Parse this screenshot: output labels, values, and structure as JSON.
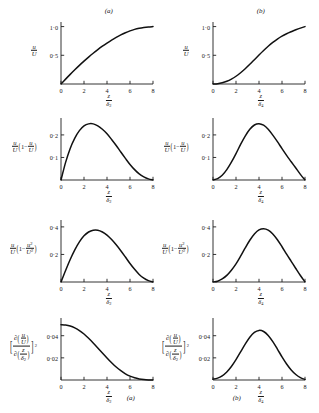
{
  "figure": {
    "panel_tag_a": "(a)",
    "panel_tag_b": "(b)",
    "bottom_tag_a": "(a)",
    "bottom_tag_b": "(b)",
    "symbols": {
      "u": "u",
      "U": "U",
      "z": "z",
      "delta": "δ",
      "sub2": "2",
      "sub4": "4",
      "partial": "∂",
      "one": "1",
      "minus": "−",
      "sq": "2",
      "open_paren": "(",
      "close_paren": ")",
      "open_brack": "[",
      "close_brack": "]"
    },
    "xticklabels": [
      "0",
      "2",
      "4",
      "6",
      "8"
    ],
    "xtickvalues": [
      0,
      2,
      4,
      6,
      8
    ],
    "rows": [
      {
        "ylabel_kind": "u_over_U",
        "yticklabels": [
          "1·0",
          "0·5"
        ],
        "ytickvalues": [
          1.0,
          0.5
        ],
        "ylim": [
          0,
          1.08
        ]
      },
      {
        "ylabel_kind": "mom_thickness",
        "yticklabels": [
          "0·2",
          "0·1"
        ],
        "ytickvalues": [
          0.2,
          0.1
        ],
        "ylim": [
          0,
          0.275
        ]
      },
      {
        "ylabel_kind": "energy_thickness",
        "yticklabels": [
          "0·4",
          "0·2"
        ],
        "ytickvalues": [
          0.4,
          0.2
        ],
        "ylim": [
          0,
          0.45
        ]
      },
      {
        "ylabel_kind": "grad_squared",
        "yticklabels": [
          "0·04",
          "0·02"
        ],
        "ytickvalues": [
          0.04,
          0.02
        ],
        "ylim": [
          0,
          0.056
        ]
      }
    ]
  },
  "chart_data": [
    {
      "id": "r1a",
      "type": "line",
      "title": "(a)",
      "xlabel": "z/δ₂",
      "ylabel": "u/U",
      "xlim": [
        0,
        8
      ],
      "ylim": [
        0,
        1.08
      ],
      "xticks": [
        0,
        2,
        4,
        6,
        8
      ],
      "yticks": [
        0.5,
        1.0
      ],
      "grid": false,
      "x": [
        0,
        0.4,
        0.8,
        1.2,
        1.6,
        2.0,
        2.4,
        2.8,
        3.2,
        3.6,
        4.0,
        4.4,
        4.8,
        5.2,
        5.6,
        6.0,
        6.4,
        6.8,
        7.2,
        7.6,
        8.0
      ],
      "y": [
        0.0,
        0.085,
        0.168,
        0.248,
        0.325,
        0.398,
        0.468,
        0.535,
        0.598,
        0.658,
        0.713,
        0.765,
        0.812,
        0.855,
        0.893,
        0.925,
        0.952,
        0.972,
        0.986,
        0.995,
        1.0
      ]
    },
    {
      "id": "r1b",
      "type": "line",
      "title": "(b)",
      "xlabel": "z/δ₄",
      "ylabel": "u/U",
      "xlim": [
        0,
        8
      ],
      "ylim": [
        0,
        1.08
      ],
      "xticks": [
        0,
        2,
        4,
        6,
        8
      ],
      "yticks": [
        0.5,
        1.0
      ],
      "grid": false,
      "x": [
        0,
        0.4,
        0.8,
        1.2,
        1.6,
        2.0,
        2.4,
        2.8,
        3.2,
        3.6,
        4.0,
        4.4,
        4.8,
        5.2,
        5.6,
        6.0,
        6.4,
        6.8,
        7.2,
        7.6,
        8.0
      ],
      "y": [
        0.0,
        0.006,
        0.022,
        0.048,
        0.086,
        0.135,
        0.196,
        0.266,
        0.343,
        0.424,
        0.505,
        0.584,
        0.658,
        0.725,
        0.783,
        0.833,
        0.875,
        0.911,
        0.944,
        0.974,
        1.0
      ]
    },
    {
      "id": "r2a",
      "type": "line",
      "title": "",
      "xlabel": "z/δ₂",
      "ylabel": "(u/U)(1−u/U)",
      "xlim": [
        0,
        8
      ],
      "ylim": [
        0,
        0.275
      ],
      "xticks": [
        0,
        2,
        4,
        6,
        8
      ],
      "yticks": [
        0.1,
        0.2
      ],
      "grid": false,
      "x": [
        0,
        0.4,
        0.8,
        1.2,
        1.6,
        2.0,
        2.4,
        2.8,
        3.2,
        3.6,
        4.0,
        4.4,
        4.8,
        5.2,
        5.6,
        6.0,
        6.4,
        6.8,
        7.2,
        7.6,
        8.0
      ],
      "y": [
        0.0,
        0.078,
        0.14,
        0.186,
        0.219,
        0.24,
        0.249,
        0.249,
        0.24,
        0.225,
        0.205,
        0.18,
        0.153,
        0.124,
        0.096,
        0.069,
        0.046,
        0.027,
        0.014,
        0.005,
        0.0
      ]
    },
    {
      "id": "r2b",
      "type": "line",
      "title": "",
      "xlabel": "z/δ₄",
      "ylabel": "(u/U)(1−u/U)",
      "xlim": [
        0,
        8
      ],
      "ylim": [
        0,
        0.275
      ],
      "xticks": [
        0,
        2,
        4,
        6,
        8
      ],
      "yticks": [
        0.1,
        0.2
      ],
      "grid": false,
      "x": [
        0,
        0.4,
        0.8,
        1.2,
        1.6,
        2.0,
        2.4,
        2.8,
        3.2,
        3.6,
        4.0,
        4.4,
        4.8,
        5.2,
        5.6,
        6.0,
        6.4,
        6.8,
        7.2,
        7.6,
        8.0
      ],
      "y": [
        0.0,
        0.006,
        0.021,
        0.046,
        0.079,
        0.117,
        0.158,
        0.195,
        0.225,
        0.244,
        0.25,
        0.243,
        0.225,
        0.199,
        0.17,
        0.139,
        0.109,
        0.081,
        0.053,
        0.025,
        0.0
      ]
    },
    {
      "id": "r3a",
      "type": "line",
      "title": "",
      "xlabel": "z/δ₂",
      "ylabel": "(u/U)(1−u²/U²)",
      "xlim": [
        0,
        8
      ],
      "ylim": [
        0,
        0.45
      ],
      "xticks": [
        0,
        2,
        4,
        6,
        8
      ],
      "yticks": [
        0.2,
        0.4
      ],
      "grid": false,
      "x": [
        0,
        0.4,
        0.8,
        1.2,
        1.6,
        2.0,
        2.4,
        2.8,
        3.2,
        3.6,
        4.0,
        4.4,
        4.8,
        5.2,
        5.6,
        6.0,
        6.4,
        6.8,
        7.2,
        7.6,
        8.0
      ],
      "y": [
        0.0,
        0.084,
        0.163,
        0.233,
        0.291,
        0.335,
        0.363,
        0.376,
        0.376,
        0.363,
        0.34,
        0.308,
        0.27,
        0.227,
        0.181,
        0.134,
        0.092,
        0.055,
        0.028,
        0.01,
        0.0
      ]
    },
    {
      "id": "r3b",
      "type": "line",
      "title": "",
      "xlabel": "z/δ₄",
      "ylabel": "(u/U)(1−u²/U²)",
      "xlim": [
        0,
        8
      ],
      "ylim": [
        0,
        0.45
      ],
      "xticks": [
        0,
        2,
        4,
        6,
        8
      ],
      "yticks": [
        0.2,
        0.4
      ],
      "grid": false,
      "x": [
        0,
        0.4,
        0.8,
        1.2,
        1.6,
        2.0,
        2.4,
        2.8,
        3.2,
        3.6,
        4.0,
        4.4,
        4.8,
        5.2,
        5.6,
        6.0,
        6.4,
        6.8,
        7.2,
        7.6,
        8.0
      ],
      "y": [
        0.0,
        0.006,
        0.022,
        0.048,
        0.085,
        0.131,
        0.187,
        0.247,
        0.303,
        0.349,
        0.378,
        0.387,
        0.377,
        0.349,
        0.307,
        0.256,
        0.202,
        0.15,
        0.098,
        0.047,
        0.0
      ]
    },
    {
      "id": "r4a",
      "type": "line",
      "title": "(a)",
      "xlabel": "z/δ₂",
      "ylabel": "[∂(u/U)/∂(z/δ₂)]²",
      "xlim": [
        0,
        8
      ],
      "ylim": [
        0,
        0.056
      ],
      "xticks": [
        0,
        2,
        4,
        6,
        8
      ],
      "yticks": [
        0.02,
        0.04
      ],
      "grid": false,
      "x": [
        0,
        0.4,
        0.8,
        1.2,
        1.6,
        2.0,
        2.4,
        2.8,
        3.2,
        3.6,
        4.0,
        4.4,
        4.8,
        5.2,
        5.6,
        6.0,
        6.4,
        6.8,
        7.2,
        7.6,
        8.0
      ],
      "y": [
        0.05,
        0.0497,
        0.0488,
        0.0471,
        0.0447,
        0.0415,
        0.0377,
        0.0335,
        0.029,
        0.0244,
        0.0199,
        0.0156,
        0.0117,
        0.0084,
        0.0056,
        0.0035,
        0.002,
        0.001,
        0.0004,
        0.0001,
        0.0
      ]
    },
    {
      "id": "r4b",
      "type": "line",
      "title": "(b)",
      "xlabel": "z/δ₄",
      "ylabel": "[∂(u/U)/∂(z/δ₂)]²",
      "xlim": [
        0,
        8
      ],
      "ylim": [
        0,
        0.056
      ],
      "xticks": [
        0,
        2,
        4,
        6,
        8
      ],
      "yticks": [
        0.02,
        0.04
      ],
      "grid": false,
      "x": [
        0,
        0.4,
        0.8,
        1.2,
        1.6,
        2.0,
        2.4,
        2.8,
        3.2,
        3.6,
        4.0,
        4.4,
        4.8,
        5.2,
        5.6,
        6.0,
        6.4,
        6.8,
        7.2,
        7.6,
        8.0
      ],
      "y": [
        0.0008,
        0.0017,
        0.0038,
        0.0073,
        0.0122,
        0.0184,
        0.0254,
        0.0324,
        0.0386,
        0.043,
        0.0448,
        0.0438,
        0.0402,
        0.0346,
        0.0279,
        0.0209,
        0.0145,
        0.0091,
        0.005,
        0.0021,
        0.0005
      ]
    }
  ]
}
